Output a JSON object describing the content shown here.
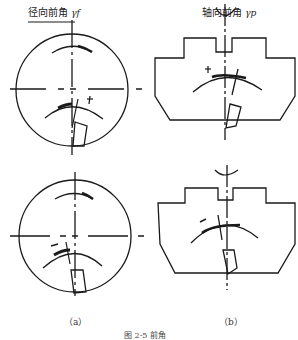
{
  "panels": [
    {
      "id": "a",
      "title": "径向前角",
      "symbol": "γf",
      "sub_label": "（a）",
      "sign_top": "+",
      "sign_bottom": "−"
    },
    {
      "id": "b",
      "title": "轴向前角",
      "symbol": "γp",
      "sub_label": "（b）",
      "sign_top": "+",
      "sign_bottom": "−"
    }
  ],
  "caption": "图 2-5 前角",
  "colors": {
    "stroke": "#1a1a1a",
    "background": "#ffffff"
  }
}
